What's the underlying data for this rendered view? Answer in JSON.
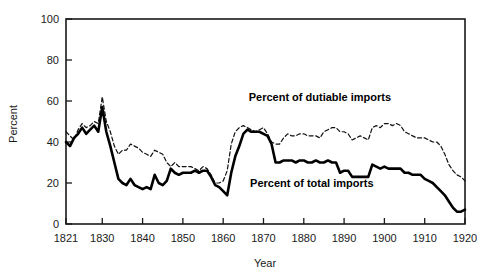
{
  "chart_data": {
    "type": "line",
    "title": "",
    "xlabel": "Year",
    "ylabel": "Percent",
    "xlim": [
      1821,
      1920
    ],
    "ylim": [
      0,
      100
    ],
    "grid": false,
    "legend_position": "inline-annotations",
    "xticks": [
      1821,
      1830,
      1840,
      1850,
      1860,
      1870,
      1880,
      1890,
      1900,
      1910,
      1920
    ],
    "xticklabels": [
      "1821",
      "1830",
      "1840",
      "1850",
      "1860",
      "1870",
      "1880",
      "1890",
      "1900",
      "1910",
      "1920"
    ],
    "yticks": [
      0,
      20,
      40,
      60,
      80,
      100
    ],
    "yticklabels": [
      "0",
      "20",
      "40",
      "60",
      "80",
      "100"
    ],
    "annotations": [
      {
        "text": "Percent of dutiable imports",
        "x": 1884,
        "y": 60
      },
      {
        "text": "Percent of total imports",
        "x": 1882,
        "y": 18
      }
    ],
    "x": [
      1821,
      1822,
      1823,
      1824,
      1825,
      1826,
      1827,
      1828,
      1829,
      1830,
      1831,
      1832,
      1833,
      1834,
      1835,
      1836,
      1837,
      1838,
      1839,
      1840,
      1841,
      1842,
      1843,
      1844,
      1845,
      1846,
      1847,
      1848,
      1849,
      1850,
      1851,
      1852,
      1853,
      1854,
      1855,
      1856,
      1857,
      1858,
      1859,
      1860,
      1861,
      1862,
      1863,
      1864,
      1865,
      1866,
      1867,
      1868,
      1869,
      1870,
      1871,
      1872,
      1873,
      1874,
      1875,
      1876,
      1877,
      1878,
      1879,
      1880,
      1881,
      1882,
      1883,
      1884,
      1885,
      1886,
      1887,
      1888,
      1889,
      1890,
      1891,
      1892,
      1893,
      1894,
      1895,
      1896,
      1897,
      1898,
      1899,
      1900,
      1901,
      1902,
      1903,
      1904,
      1905,
      1906,
      1907,
      1908,
      1909,
      1910,
      1911,
      1912,
      1913,
      1914,
      1915,
      1916,
      1917,
      1918,
      1919,
      1920
    ],
    "series": [
      {
        "name": "Percent of dutiable imports",
        "style": "dashed",
        "color": "#111111",
        "values": [
          45,
          43,
          41,
          46,
          49,
          47,
          48,
          50,
          49,
          62,
          50,
          45,
          38,
          34,
          36,
          36,
          39,
          38,
          37,
          35,
          34,
          33,
          36,
          35,
          34,
          30,
          28,
          30,
          28,
          28,
          28,
          28,
          27,
          26,
          28,
          27,
          24,
          20,
          20,
          21,
          26,
          39,
          45,
          47,
          48,
          47,
          46,
          45,
          46,
          47,
          44,
          40,
          39,
          39,
          42,
          44,
          43,
          43,
          44,
          44,
          43,
          43,
          43,
          42,
          45,
          46,
          47,
          47,
          45,
          45,
          44,
          41,
          42,
          43,
          42,
          41,
          47,
          48,
          47,
          49,
          49,
          48,
          49,
          48,
          45,
          44,
          43,
          42,
          42,
          42,
          41,
          40,
          40,
          38,
          34,
          29,
          26,
          24,
          23,
          21
        ]
      },
      {
        "name": "Percent of total imports",
        "style": "solid",
        "color": "#000000",
        "values": [
          40,
          38,
          42,
          44,
          47,
          44,
          46,
          48,
          45,
          57,
          45,
          38,
          30,
          22,
          20,
          19,
          22,
          19,
          18,
          17,
          18,
          17,
          24,
          20,
          19,
          21,
          27,
          25,
          24,
          25,
          25,
          25,
          26,
          25,
          26,
          26,
          23,
          19,
          18,
          16,
          14,
          25,
          33,
          38,
          44,
          46,
          45,
          45,
          45,
          44,
          43,
          39,
          30,
          30,
          31,
          31,
          31,
          30,
          31,
          31,
          30,
          30,
          31,
          30,
          30,
          31,
          30,
          30,
          25,
          26,
          26,
          23,
          23,
          23,
          23,
          23,
          29,
          28,
          27,
          28,
          27,
          27,
          27,
          27,
          25,
          25,
          24,
          24,
          24,
          22,
          21,
          20,
          18,
          16,
          14,
          11,
          8,
          6,
          6,
          7
        ]
      }
    ]
  },
  "colors": {
    "axis": "#1a1a1a",
    "background": "#ffffff",
    "solid_series": "#000000",
    "dashed_series": "#111111"
  }
}
